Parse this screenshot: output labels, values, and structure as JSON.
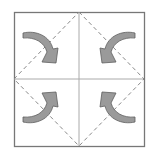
{
  "diagram": {
    "type": "origami-fold-instruction",
    "square": {
      "x": 14,
      "y": 12,
      "width": 130,
      "height": 134
    },
    "center": {
      "x": 79,
      "y": 79
    },
    "creases": [
      "vertical-center",
      "horizontal-center"
    ],
    "fold_lines": {
      "style": "dashed",
      "shape": "diamond",
      "points": [
        [
          79,
          12
        ],
        [
          144,
          79
        ],
        [
          79,
          146
        ],
        [
          14,
          79
        ]
      ]
    },
    "arrows": [
      {
        "id": "top-left",
        "direction": "fold corner toward center"
      },
      {
        "id": "top-right",
        "direction": "fold corner toward center"
      },
      {
        "id": "bottom-left",
        "direction": "fold corner toward center"
      },
      {
        "id": "bottom-right",
        "direction": "fold corner toward center"
      }
    ],
    "colors": {
      "border": "#777777",
      "crease": "#aaaaaa",
      "dashed": "#8a8a8a",
      "arrow_fill": "#9a9a9a",
      "arrow_stroke": "#5e5e5e",
      "background": "#ffffff"
    }
  }
}
